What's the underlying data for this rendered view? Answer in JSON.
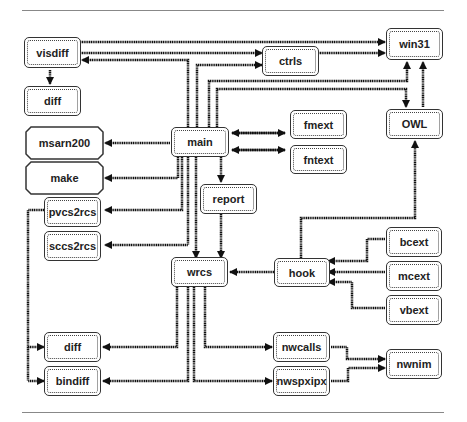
{
  "diagram": {
    "nodes": {
      "visdiff": "visdiff",
      "diff_top": "diff",
      "msarn200": "msarn200",
      "make": "make",
      "pvcs2rcs": "pvcs2rcs",
      "sccs2rcs": "sccs2rcs",
      "main": "main",
      "ctrls": "ctrls",
      "win31": "win31",
      "fmext": "fmext",
      "fntext": "fntext",
      "owl": "OWL",
      "report": "report",
      "wrcs": "wrcs",
      "hook": "hook",
      "bcext": "bcext",
      "mcext": "mcext",
      "vbext": "vbext",
      "diff_bottom": "diff",
      "bindiff": "bindiff",
      "nwcalls": "nwcalls",
      "nwspxipx": "nwspxipx",
      "nwnim": "nwnim"
    },
    "edges": [
      [
        "visdiff",
        "win31"
      ],
      [
        "visdiff",
        "ctrls"
      ],
      [
        "main",
        "visdiff"
      ],
      [
        "visdiff",
        "diff"
      ],
      [
        "main",
        "ctrls"
      ],
      [
        "ctrls",
        "win31"
      ],
      [
        "main",
        "win31"
      ],
      [
        "main",
        "OWL"
      ],
      [
        "OWL",
        "win31"
      ],
      [
        "main",
        "msarn200"
      ],
      [
        "main",
        "make"
      ],
      [
        "main",
        "pvcs2rcs"
      ],
      [
        "main",
        "sccs2rcs"
      ],
      [
        "main",
        "fmext"
      ],
      [
        "fmext",
        "main"
      ],
      [
        "main",
        "fntext"
      ],
      [
        "fntext",
        "main"
      ],
      [
        "main",
        "report"
      ],
      [
        "main",
        "wrcs"
      ],
      [
        "report",
        "wrcs"
      ],
      [
        "hook",
        "wrcs"
      ],
      [
        "hook",
        "OWL"
      ],
      [
        "bcext",
        "hook"
      ],
      [
        "mcext",
        "hook"
      ],
      [
        "vbext",
        "hook"
      ],
      [
        "wrcs",
        "diff"
      ],
      [
        "wrcs",
        "bindiff"
      ],
      [
        "pvcs2rcs",
        "diff"
      ],
      [
        "pvcs2rcs",
        "bindiff"
      ],
      [
        "wrcs",
        "nwcalls"
      ],
      [
        "wrcs",
        "nwspxipx"
      ],
      [
        "nwcalls",
        "nwnim"
      ],
      [
        "nwspxipx",
        "nwnim"
      ]
    ]
  }
}
